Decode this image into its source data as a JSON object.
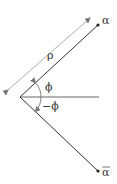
{
  "diagram": {
    "labels": {
      "alpha": "α",
      "alpha_bar": "α",
      "rho": "ρ",
      "phi": "ϕ",
      "neg_phi": "−ϕ"
    },
    "colors": {
      "line": "#333333",
      "guide": "#999999",
      "background": "#ffffff"
    }
  }
}
